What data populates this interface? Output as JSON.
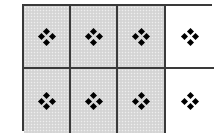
{
  "diagram": {
    "type": "grid",
    "rows": 2,
    "columns": 4,
    "cell_icon": "four-diamond-icon",
    "colors": {
      "shaded": "#d9d9d9",
      "unshaded": "#ffffff",
      "border": "#3a3a3a",
      "icon": "#000000"
    },
    "cells": [
      {
        "row": 0,
        "col": 0,
        "shaded": true,
        "icon": "four-diamond-icon"
      },
      {
        "row": 0,
        "col": 1,
        "shaded": true,
        "icon": "four-diamond-icon"
      },
      {
        "row": 0,
        "col": 2,
        "shaded": true,
        "icon": "four-diamond-icon"
      },
      {
        "row": 0,
        "col": 3,
        "shaded": false,
        "icon": "four-diamond-icon"
      },
      {
        "row": 1,
        "col": 0,
        "shaded": true,
        "icon": "four-diamond-icon"
      },
      {
        "row": 1,
        "col": 1,
        "shaded": true,
        "icon": "four-diamond-icon"
      },
      {
        "row": 1,
        "col": 2,
        "shaded": true,
        "icon": "four-diamond-icon"
      },
      {
        "row": 1,
        "col": 3,
        "shaded": false,
        "icon": "four-diamond-icon"
      }
    ],
    "shaded_count": 6,
    "total_count": 8
  }
}
